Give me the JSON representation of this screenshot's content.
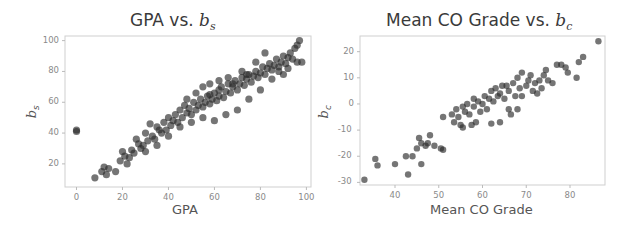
{
  "chart_data": [
    {
      "type": "scatter",
      "title": "GPA vs. b_s",
      "title_main": "GPA vs. ",
      "title_var": "b",
      "title_sub": "s",
      "xlabel": "GPA",
      "ylabel": "b_s",
      "ylabel_main": "b",
      "ylabel_sub": "s",
      "xlim": [
        -5,
        102
      ],
      "ylim": [
        5,
        103
      ],
      "xticks": [
        "0",
        "20",
        "40",
        "60",
        "80",
        "100"
      ],
      "yticks": [
        "20",
        "40",
        "60",
        "80",
        "100"
      ],
      "grid": false,
      "marker_color": "#2b2b2b",
      "description": "Dense positive linear relationship; one outlier at GPA=0, b_s≈41",
      "points": [
        [
          0,
          41
        ],
        [
          0,
          42
        ],
        [
          8,
          11
        ],
        [
          11,
          15
        ],
        [
          12,
          18
        ],
        [
          13,
          13
        ],
        [
          14,
          17
        ],
        [
          17,
          15
        ],
        [
          19,
          22
        ],
        [
          20,
          28
        ],
        [
          21,
          25
        ],
        [
          22,
          20
        ],
        [
          23,
          24
        ],
        [
          24,
          29
        ],
        [
          25,
          27
        ],
        [
          26,
          36
        ],
        [
          27,
          33
        ],
        [
          28,
          30
        ],
        [
          29,
          32
        ],
        [
          30,
          40
        ],
        [
          31,
          35
        ],
        [
          32,
          46
        ],
        [
          33,
          38
        ],
        [
          34,
          36
        ],
        [
          35,
          44
        ],
        [
          36,
          42
        ],
        [
          37,
          40
        ],
        [
          38,
          47
        ],
        [
          39,
          42
        ],
        [
          40,
          50
        ],
        [
          41,
          45
        ],
        [
          42,
          48
        ],
        [
          43,
          52
        ],
        [
          44,
          47
        ],
        [
          45,
          55
        ],
        [
          46,
          50
        ],
        [
          47,
          58
        ],
        [
          48,
          53
        ],
        [
          49,
          56
        ],
        [
          50,
          52
        ],
        [
          51,
          60
        ],
        [
          52,
          55
        ],
        [
          53,
          58
        ],
        [
          54,
          62
        ],
        [
          55,
          57
        ],
        [
          56,
          60
        ],
        [
          57,
          64
        ],
        [
          58,
          59
        ],
        [
          59,
          62
        ],
        [
          60,
          66
        ],
        [
          61,
          61
        ],
        [
          62,
          64
        ],
        [
          63,
          70
        ],
        [
          64,
          63
        ],
        [
          65,
          67
        ],
        [
          66,
          72
        ],
        [
          67,
          66
        ],
        [
          68,
          70
        ],
        [
          69,
          74
        ],
        [
          70,
          68
        ],
        [
          71,
          72
        ],
        [
          72,
          76
        ],
        [
          73,
          71
        ],
        [
          74,
          75
        ],
        [
          75,
          78
        ],
        [
          76,
          73
        ],
        [
          77,
          77
        ],
        [
          78,
          80
        ],
        [
          79,
          76
        ],
        [
          80,
          79
        ],
        [
          81,
          83
        ],
        [
          82,
          78
        ],
        [
          83,
          82
        ],
        [
          84,
          85
        ],
        [
          85,
          81
        ],
        [
          86,
          84
        ],
        [
          87,
          88
        ],
        [
          88,
          83
        ],
        [
          89,
          86
        ],
        [
          90,
          90
        ],
        [
          91,
          85
        ],
        [
          92,
          89
        ],
        [
          93,
          92
        ],
        [
          94,
          88
        ],
        [
          95,
          95
        ],
        [
          96,
          97
        ],
        [
          97,
          100
        ],
        [
          98,
          86
        ],
        [
          55,
          70
        ],
        [
          60,
          48
        ],
        [
          65,
          52
        ],
        [
          70,
          55
        ],
        [
          75,
          62
        ],
        [
          80,
          68
        ],
        [
          85,
          75
        ],
        [
          90,
          78
        ],
        [
          48,
          62
        ],
        [
          52,
          66
        ],
        [
          58,
          72
        ],
        [
          62,
          74
        ],
        [
          66,
          76
        ],
        [
          72,
          80
        ],
        [
          78,
          86
        ],
        [
          82,
          92
        ],
        [
          45,
          44
        ],
        [
          50,
          47
        ],
        [
          55,
          50
        ],
        [
          40,
          38
        ],
        [
          35,
          32
        ],
        [
          30,
          28
        ],
        [
          58,
          65
        ],
        [
          62,
          68
        ],
        [
          68,
          72
        ],
        [
          74,
          78
        ],
        [
          88,
          80
        ],
        [
          92,
          82
        ],
        [
          96,
          86
        ]
      ]
    },
    {
      "type": "scatter",
      "title": "Mean CO Grade vs. b_c",
      "title_main": "Mean CO Grade vs. ",
      "title_var": "b",
      "title_sub": "c",
      "xlabel": "Mean CO Grade",
      "ylabel": "b_c",
      "ylabel_main": "b",
      "ylabel_sub": "c",
      "xlim": [
        32,
        88
      ],
      "ylim": [
        -31,
        26
      ],
      "xticks": [
        "40",
        "50",
        "60",
        "70",
        "80"
      ],
      "yticks": [
        "20",
        "10",
        "0",
        "-10",
        "-20",
        "-30"
      ],
      "grid": false,
      "marker_color": "#2b2b2b",
      "description": "Positive linear relationship between Mean CO Grade and b_c",
      "points": [
        [
          33,
          -29
        ],
        [
          35.5,
          -21
        ],
        [
          36,
          -23.5
        ],
        [
          40,
          -23
        ],
        [
          42.5,
          -20
        ],
        [
          43,
          -27
        ],
        [
          44,
          -20
        ],
        [
          45,
          -17
        ],
        [
          45.5,
          -13
        ],
        [
          46,
          -23
        ],
        [
          46,
          -15
        ],
        [
          47,
          -16
        ],
        [
          47.5,
          -15
        ],
        [
          48,
          -12
        ],
        [
          49,
          -16
        ],
        [
          50.5,
          -17
        ],
        [
          51,
          -5
        ],
        [
          51,
          -17.5
        ],
        [
          53,
          -4
        ],
        [
          53.5,
          -7
        ],
        [
          54,
          -2
        ],
        [
          54.5,
          -5
        ],
        [
          55,
          -8
        ],
        [
          55.5,
          -9
        ],
        [
          55.5,
          -1
        ],
        [
          56,
          -3
        ],
        [
          56.5,
          0
        ],
        [
          57,
          -4
        ],
        [
          57.5,
          -8
        ],
        [
          58,
          -1
        ],
        [
          58,
          2
        ],
        [
          58.5,
          -7
        ],
        [
          59,
          1
        ],
        [
          59.5,
          -3
        ],
        [
          60,
          0
        ],
        [
          60.5,
          3
        ],
        [
          61,
          -2
        ],
        [
          61.5,
          2
        ],
        [
          62,
          5
        ],
        [
          62,
          -7.5
        ],
        [
          62.5,
          1
        ],
        [
          63,
          6
        ],
        [
          63.5,
          3
        ],
        [
          64,
          -7
        ],
        [
          64,
          4
        ],
        [
          64.5,
          7
        ],
        [
          65,
          2
        ],
        [
          65.5,
          7
        ],
        [
          66,
          5
        ],
        [
          66,
          -2
        ],
        [
          66.5,
          -4
        ],
        [
          67,
          8
        ],
        [
          67.5,
          3
        ],
        [
          68,
          10
        ],
        [
          68,
          -2
        ],
        [
          68.5,
          6
        ],
        [
          69,
          12
        ],
        [
          69,
          3
        ],
        [
          70,
          7
        ],
        [
          70.5,
          9
        ],
        [
          71,
          11
        ],
        [
          71.5,
          5
        ],
        [
          72,
          8
        ],
        [
          72.5,
          4
        ],
        [
          73,
          9
        ],
        [
          73.5,
          6
        ],
        [
          74,
          11
        ],
        [
          74.5,
          13
        ],
        [
          75,
          9
        ],
        [
          76,
          8
        ],
        [
          77,
          15
        ],
        [
          78,
          15
        ],
        [
          79,
          14
        ],
        [
          79.5,
          12
        ],
        [
          81.5,
          10
        ],
        [
          82,
          16
        ],
        [
          83,
          18
        ],
        [
          86.5,
          24
        ]
      ]
    }
  ]
}
